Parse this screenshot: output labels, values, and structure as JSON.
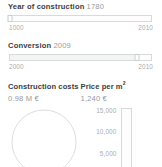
{
  "colors": {
    "background": "#ffffff",
    "label_text": "#3c4043",
    "value_text": "#97999b",
    "axis_text": "#a9abad",
    "outline": "#d7d9da"
  },
  "fields": [
    {
      "label": "Year of construction",
      "value": "1780",
      "slider": {
        "min_label": "1000",
        "max_label": "2010",
        "fill_percent": 0,
        "handle_percent": 0
      }
    },
    {
      "label": "Conversion",
      "value": "2009",
      "slider": {
        "min_label": "2000",
        "max_label": "2010",
        "fill_percent": 90,
        "handle_percent": 90
      }
    }
  ],
  "stats": [
    {
      "title": "Construction costs",
      "title_sup": "",
      "value": "0.98 M €"
    },
    {
      "title": "Price per m",
      "title_sup": "2",
      "value": "1,240 €"
    }
  ],
  "chart_data": [
    {
      "type": "pie",
      "name": "construction-costs-donut",
      "title": "Construction costs",
      "categories": [],
      "values": [],
      "total_label": "0.98 M €",
      "empty": true
    },
    {
      "type": "bar",
      "name": "price-per-sqm-gauge",
      "title": "Price per m²",
      "orientation": "vertical",
      "categories": [
        "Price per m²"
      ],
      "values": [
        1240
      ],
      "value_label": "1,240 €",
      "ylabel": "",
      "ylim": [
        0,
        15000
      ],
      "ticks": [
        15000,
        10000,
        5000,
        0
      ],
      "tick_labels": [
        "15,000",
        "10,000",
        "5,000",
        "0"
      ],
      "grid": false,
      "legend": "none",
      "fill_percent": 0,
      "empty": true
    }
  ],
  "gauge": {
    "ticks": [
      {
        "label": "15,000",
        "percent": 100
      },
      {
        "label": "10,000",
        "percent": 66.7
      },
      {
        "label": "5,000",
        "percent": 33.3
      },
      {
        "label": "0",
        "percent": 0
      }
    ]
  }
}
